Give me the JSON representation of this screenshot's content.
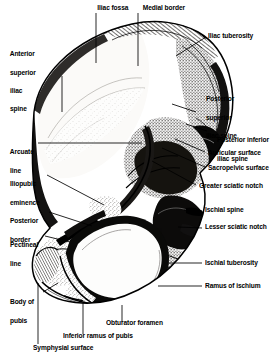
{
  "figure": {
    "style": "black-and-white stipple and line engraving",
    "colors": {
      "ink": "#000000",
      "background": "#ffffff",
      "bone_light": "#f2f0ec",
      "bone_mid": "#b9b4ac",
      "bone_dark": "#3a3733"
    }
  },
  "labels": [
    {
      "id": "iliac-fossa",
      "text": "Iliac fossa",
      "lines": [
        "Iliac fossa"
      ]
    },
    {
      "id": "medial-border",
      "text": "Medial border",
      "lines": [
        "Medial border"
      ]
    },
    {
      "id": "iliac-tuberosity",
      "text": "Iliac tuberosity",
      "lines": [
        "Iliac tuberosity"
      ]
    },
    {
      "id": "anterior-superior-iliac-spine",
      "text": "Anterior superior iliac spine",
      "lines": [
        "Anterior",
        "superior",
        "iliac",
        "spine"
      ]
    },
    {
      "id": "posterior-superior-iliac-spine",
      "text": "Posterior superior iliac spine",
      "lines": [
        "Posterior",
        "superior",
        "iliac spine"
      ]
    },
    {
      "id": "posterior-inferior-iliac-spine",
      "text": "Posterior inferior iliac spine",
      "lines": [
        "Posterior inferior",
        "iliac spine"
      ]
    },
    {
      "id": "auricular-surface",
      "text": "Auricular surface",
      "lines": [
        "Auricular surface"
      ]
    },
    {
      "id": "sacropelvic-surface",
      "text": "Sacropelvic surface",
      "lines": [
        "Sacropelvic surface"
      ]
    },
    {
      "id": "greater-sciatic-notch",
      "text": "Greater sciatic notch",
      "lines": [
        "Greater sciatic notch"
      ]
    },
    {
      "id": "arcuate-line",
      "text": "Arcuate line",
      "lines": [
        "Arcuate",
        "line"
      ]
    },
    {
      "id": "iliopubic-eminence",
      "text": "Iliopubic eminence",
      "lines": [
        "Iliopubic",
        "eminence"
      ]
    },
    {
      "id": "posterior-border",
      "text": "Posterior border",
      "lines": [
        "Posterior",
        "border"
      ]
    },
    {
      "id": "pectineal-line",
      "text": "Pectineal line",
      "lines": [
        "Pectineal",
        "line"
      ]
    },
    {
      "id": "ischial-spine",
      "text": "Ischial spine",
      "lines": [
        "Ischial spine"
      ]
    },
    {
      "id": "lesser-sciatic-notch",
      "text": "Lesser sciatic notch",
      "lines": [
        "Lesser sciatic notch"
      ]
    },
    {
      "id": "ischial-tuberosity",
      "text": "Ischial tuberosity",
      "lines": [
        "Ischial tuberosity"
      ]
    },
    {
      "id": "ramus-of-ischium",
      "text": "Ramus of ischium",
      "lines": [
        "Ramus of ischium"
      ]
    },
    {
      "id": "body-of-pubis",
      "text": "Body of pubis",
      "lines": [
        "Body of",
        "pubis"
      ]
    },
    {
      "id": "obturator-foramen",
      "text": "Obturator foramen",
      "lines": [
        "Obturator foramen"
      ]
    },
    {
      "id": "inferior-ramus-of-pubis",
      "text": "Inferior ramus of pubis",
      "lines": [
        "Inferior ramus of pubis"
      ]
    },
    {
      "id": "symphysial-surface",
      "text": "Symphysial surface",
      "lines": [
        "Symphysial surface"
      ]
    }
  ]
}
